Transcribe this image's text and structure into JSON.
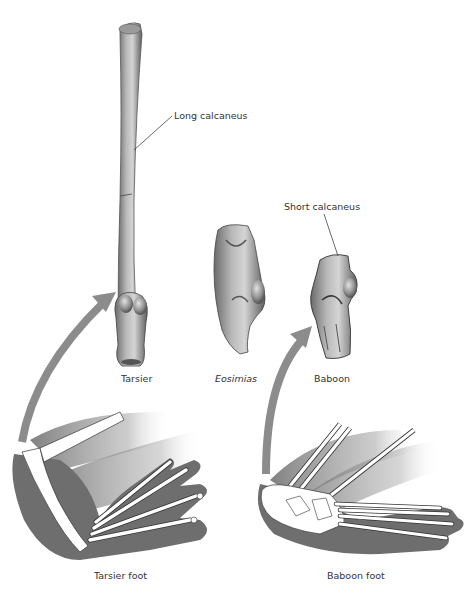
{
  "figure": {
    "callouts": {
      "long_calcaneus": "Long calcaneus",
      "short_calcaneus": "Short calcaneus"
    },
    "bones": [
      {
        "id": "tarsier",
        "label": "Tarsier",
        "italic": false
      },
      {
        "id": "eosimias",
        "label": "Eosimias",
        "italic": true
      },
      {
        "id": "baboon",
        "label": "Baboon",
        "italic": false
      }
    ],
    "feet": [
      {
        "id": "tarsier-foot",
        "label": "Tarsier foot"
      },
      {
        "id": "baboon-foot",
        "label": "Baboon foot"
      }
    ],
    "colors": {
      "bone_dark": "#5a5a5a",
      "bone_mid": "#9a9a9a",
      "bone_light": "#d8d8d8",
      "arrow": "#8c8c8c",
      "foot_shadow": "#6e6e6e",
      "leader_line": "#444444"
    }
  }
}
